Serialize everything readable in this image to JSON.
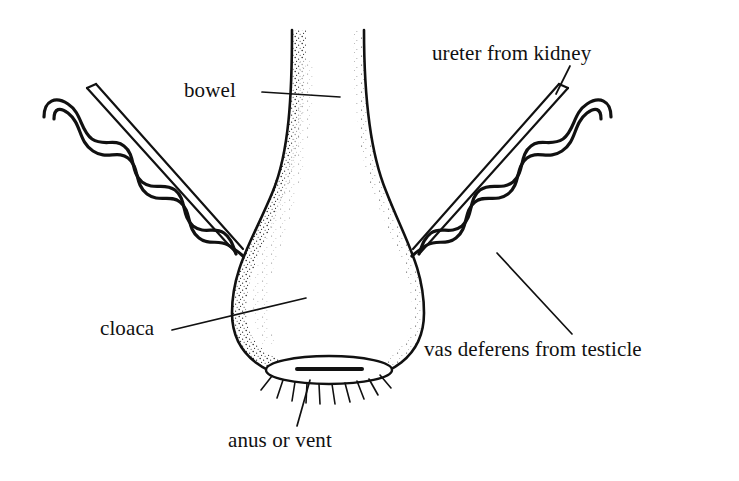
{
  "figure": {
    "type": "anatomical-line-diagram",
    "background_color": "#ffffff",
    "ink_color": "#111111",
    "labels": [
      {
        "id": "bowel",
        "text": "bowel",
        "leader": "horizontal line pointing right to the bowel tube"
      },
      {
        "id": "ureter",
        "text": "ureter from kidney",
        "leader": "short line pointing down to the straight narrow tube"
      },
      {
        "id": "cloaca",
        "text": "cloaca",
        "leader": "line rising to the right into the cloacal chamber"
      },
      {
        "id": "vas-deferens",
        "text": "vas deferens from testicle",
        "leader": "line rising to the upper left to the wavy tube"
      },
      {
        "id": "anus",
        "text": "anus or vent",
        "leader": "line rising to the vent opening"
      }
    ],
    "structures": [
      {
        "name": "bowel",
        "description": "vertical tube entering the top of the cloaca, stippled walls"
      },
      {
        "name": "cloaca",
        "description": "rounded flask shaped chamber with stippled interior walls"
      },
      {
        "name": "ureter-left",
        "description": "straight narrow double-walled tube from upper left"
      },
      {
        "name": "ureter-right",
        "description": "straight narrow double-walled tube from upper right"
      },
      {
        "name": "vas-deferens-left",
        "description": "wavy coiled double-walled tube from upper left"
      },
      {
        "name": "vas-deferens-right",
        "description": "wavy coiled double-walled tube from upper right"
      },
      {
        "name": "vent",
        "description": "elliptical opening with horizontal slit and radiating feather lines"
      }
    ]
  }
}
